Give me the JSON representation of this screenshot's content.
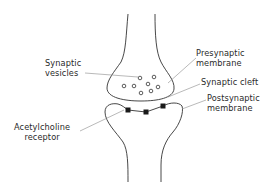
{
  "diagram": {
    "labels": {
      "synaptic_vesicles": [
        "Synaptic",
        "vesicles"
      ],
      "presynaptic_membrane": [
        "Presynaptic",
        "membrane"
      ],
      "synaptic_cleft": [
        "Synaptic cleft"
      ],
      "postsynaptic_membrane": [
        "Postsynaptic",
        "membrane"
      ],
      "acetylcholine_receptor": [
        "Acetylcholine",
        "receptor"
      ]
    },
    "colors": {
      "line": "#333333",
      "leader": "#8a8a8a",
      "receptor": "#1a1a1a",
      "background": "#ffffff"
    },
    "vesicle_count": 8,
    "receptor_count": 3
  }
}
